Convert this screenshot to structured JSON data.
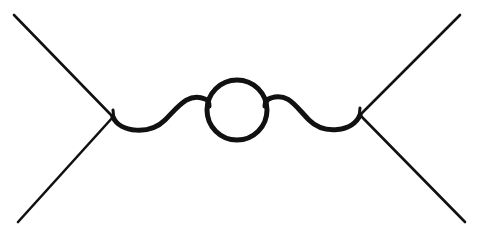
{
  "figure": {
    "background_color": "#ffffff",
    "ink_color": "#111111",
    "canvas": {
      "width": 479,
      "height": 238
    }
  },
  "geometry": {
    "left_vertex": {
      "x": 113,
      "y": 117
    },
    "right_vertex": {
      "x": 360,
      "y": 115
    },
    "loop_circle": {
      "cx": 237,
      "cy": 110,
      "r": 30
    },
    "external_legs": [
      {
        "name": "incoming-upper-left",
        "x1": 14,
        "y1": 15,
        "x2": 113,
        "y2": 117
      },
      {
        "name": "incoming-lower-left",
        "x1": 18,
        "y1": 222,
        "x2": 113,
        "y2": 117
      },
      {
        "name": "outgoing-upper-right",
        "x1": 460,
        "y1": 15,
        "x2": 360,
        "y2": 115
      },
      {
        "name": "outgoing-lower-right",
        "x1": 465,
        "y1": 222,
        "x2": 360,
        "y2": 115
      }
    ],
    "wave_left": {
      "path": "M 113 117 C 120 133 150 135 165 120 C 178 107 188 92 205 99 C 208 100 209 103 209 106",
      "trough_y": 130,
      "crest_y": 97
    },
    "wave_right": {
      "path": "M 265 106 C 265 102 267 99 271 98 C 288 92 296 107 309 120 C 324 135 353 132 360 115",
      "crest_y": 97,
      "trough_y": 130
    },
    "vertex_tick_left": {
      "x1": 113,
      "y1": 110,
      "x2": 114,
      "y2": 120
    },
    "vertex_tick_right": {
      "x1": 360,
      "y1": 108,
      "x2": 359,
      "y2": 118
    }
  },
  "strokes": {
    "leg_width": 2.6,
    "wave_width": 5,
    "loop_width": 5,
    "tick_width": 3
  }
}
